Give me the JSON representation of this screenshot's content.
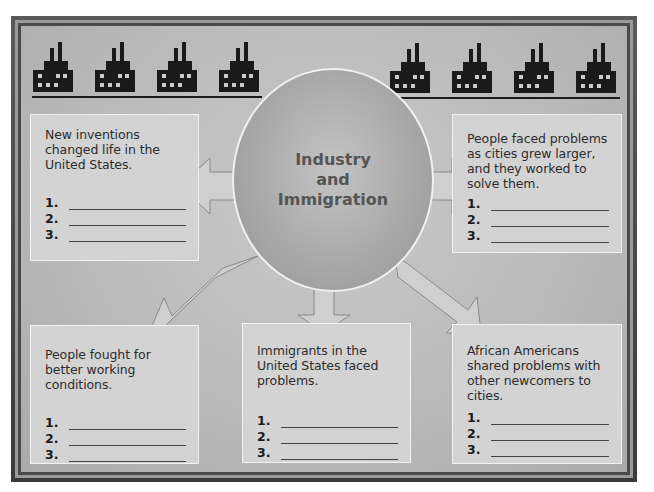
{
  "diagram": {
    "center": {
      "title_line1": "Industry",
      "title_line2": "and",
      "title_line3": "Immigration"
    },
    "decorations": {
      "factory_icons_left": 4,
      "factory_icons_right": 4
    },
    "boxes": [
      {
        "id": "top-left",
        "prompt": "New inventions changed life in the United States.",
        "items": [
          {
            "num": "1."
          },
          {
            "num": "2."
          },
          {
            "num": "3."
          }
        ]
      },
      {
        "id": "top-right",
        "prompt": "People faced problems as cities grew larger, and they worked to solve them.",
        "items": [
          {
            "num": "1."
          },
          {
            "num": "2."
          },
          {
            "num": "3."
          }
        ]
      },
      {
        "id": "bottom-left",
        "prompt": "People fought for better working conditions.",
        "items": [
          {
            "num": "1."
          },
          {
            "num": "2."
          },
          {
            "num": "3."
          }
        ]
      },
      {
        "id": "bottom-center",
        "prompt": "Immigrants in the United States faced problems.",
        "items": [
          {
            "num": "1."
          },
          {
            "num": "2."
          },
          {
            "num": "3."
          }
        ]
      },
      {
        "id": "bottom-right",
        "prompt": "African Americans shared problems with other newcomers to cities.",
        "items": [
          {
            "num": "1."
          },
          {
            "num": "2."
          },
          {
            "num": "3."
          }
        ]
      }
    ],
    "colors": {
      "panel": "#bdbdbd",
      "box": "#d3d3d3",
      "circle": "#a9a9a9",
      "arrow": "#cfcfcf",
      "factory": "#1a1a1a",
      "title_text": "#555555"
    }
  }
}
